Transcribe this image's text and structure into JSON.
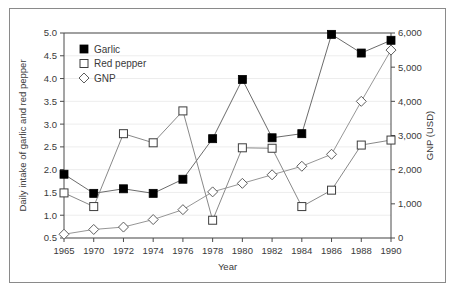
{
  "chart_data": {
    "type": "line",
    "title": "",
    "xlabel": "Year",
    "ylabel": "Daily intake of garlic and red pepper",
    "y2label": "GNP (USD)",
    "x": [
      1965,
      1970,
      1972,
      1974,
      1976,
      1978,
      1980,
      1982,
      1984,
      1986,
      1988,
      1990
    ],
    "xtick_labels": [
      "1965",
      "1970",
      "1972",
      "1974",
      "1976",
      "1978",
      "1980",
      "1982",
      "1984",
      "1986",
      "1988",
      "1990"
    ],
    "ylim": [
      0.5,
      5.0
    ],
    "ytick_values": [
      0.5,
      1.0,
      1.5,
      2.0,
      2.5,
      3.0,
      3.5,
      4.0,
      4.5,
      5.0
    ],
    "ytick_labels": [
      "0.5",
      "1.0",
      "1.5",
      "2.0",
      "2.5",
      "3.0",
      "3.5",
      "4.0",
      "4.5",
      "5.0"
    ],
    "y2lim": [
      0,
      6000
    ],
    "y2tick_values": [
      0,
      1000,
      2000,
      3000,
      4000,
      5000,
      6000
    ],
    "y2tick_labels": [
      "0",
      "1,000",
      "2,000",
      "3,000",
      "4,000",
      "5,000",
      "6,000"
    ],
    "grid": true,
    "legend_position": "upper-left-inside",
    "series": [
      {
        "name": "Garlic",
        "marker": "filled-square",
        "axis": "left",
        "values": [
          1.9,
          1.48,
          1.58,
          1.48,
          1.79,
          2.68,
          3.98,
          2.7,
          2.79,
          4.97,
          4.56,
          4.84
        ]
      },
      {
        "name": "Red pepper",
        "marker": "open-square",
        "axis": "left",
        "values": [
          1.49,
          1.19,
          2.79,
          2.59,
          3.29,
          0.89,
          2.48,
          2.47,
          1.19,
          1.55,
          2.54,
          2.65
        ]
      },
      {
        "name": "GNP",
        "marker": "open-diamond",
        "axis": "right",
        "values": [
          110,
          250,
          320,
          540,
          830,
          1350,
          1600,
          1850,
          2100,
          2450,
          4000,
          5500
        ]
      }
    ]
  },
  "colors": {
    "background": "#ffffff",
    "frame_border": "#8a8a8a",
    "axis": "#4a4a4a",
    "grid": "#ededed",
    "garlic_marker": "#000000",
    "red_pepper_marker": "#ffffff",
    "gnp_marker": "#ffffff",
    "line": "#6a6a6a",
    "text": "#3a3a3a"
  }
}
